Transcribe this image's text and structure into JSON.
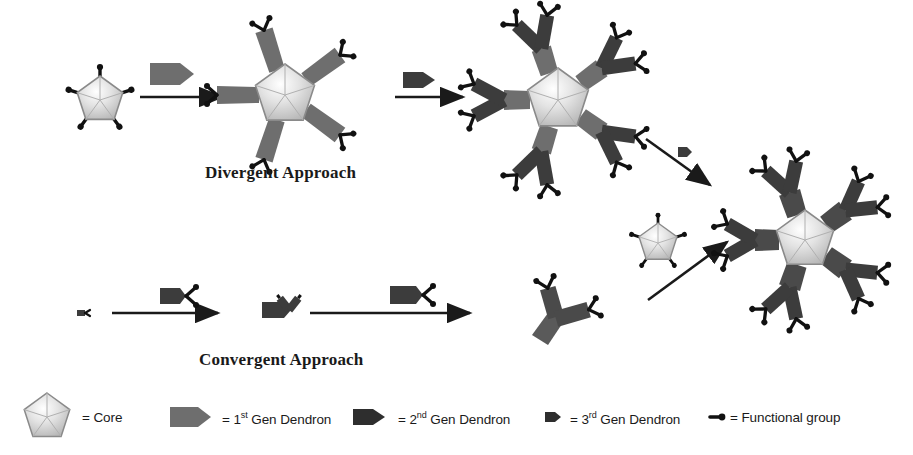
{
  "figure": {
    "type": "dendrimer-synthesis-schematic",
    "background": "#ffffff"
  },
  "labels": {
    "divergent": "Divergent Approach",
    "convergent": "Convergent Approach"
  },
  "colors": {
    "core_light": "#f2f2f2",
    "core_mid": "#c8c8c8",
    "core_edge": "#8a8a8a",
    "gen1_gray": "#6e6e6e",
    "gen2_dark": "#3c3c3c",
    "gen3_dark": "#333333",
    "functional_black": "#111111",
    "arrow_black": "#1a1a1a",
    "text": "#1a1a1a"
  },
  "legend": {
    "items": [
      {
        "key": "core",
        "icon": "pentagon-core-icon",
        "text": "= Core",
        "sup": ""
      },
      {
        "key": "gen1",
        "icon": "gen1-dendron-icon",
        "text": "Gen Dendron",
        "prefix": "= 1",
        "sup": "st"
      },
      {
        "key": "gen2",
        "icon": "gen2-dendron-icon",
        "text": "Gen Dendron",
        "prefix": "= 2",
        "sup": "nd"
      },
      {
        "key": "gen3",
        "icon": "gen3-dendron-icon",
        "text": "Gen Dendron",
        "prefix": "= 3",
        "sup": "rd"
      },
      {
        "key": "functional",
        "icon": "functional-group-icon",
        "text": "= Functional group",
        "sup": ""
      }
    ]
  },
  "divergent_row": {
    "steps": [
      {
        "name": "core-with-functional-groups",
        "generation": 0,
        "arms": 5,
        "terminal_groups": 5
      },
      {
        "name": "generation-1-dendrimer",
        "generation": 1,
        "arms": 5,
        "terminal_groups": 10
      },
      {
        "name": "generation-2-dendrimer",
        "generation": 2,
        "arms": 5,
        "terminal_groups": 20
      }
    ],
    "reagents": [
      {
        "name": "gen1-dendron-reagent",
        "generation": 1
      },
      {
        "name": "gen2-dendron-reagent",
        "generation": 2
      },
      {
        "name": "gen3-dendron-reagent",
        "generation": 3
      }
    ]
  },
  "convergent_row": {
    "steps": [
      {
        "name": "functional-group-monomer",
        "generation": 0
      },
      {
        "name": "small-dendron",
        "generation": 1
      },
      {
        "name": "large-dendron",
        "generation": 2
      }
    ],
    "reagents": [
      {
        "name": "dendron-reagent-1"
      },
      {
        "name": "dendron-reagent-2"
      },
      {
        "name": "core-reagent"
      }
    ]
  },
  "product": {
    "name": "generation-3-dendrimer",
    "generation": 3,
    "arms": 5,
    "terminal_groups": 20
  }
}
